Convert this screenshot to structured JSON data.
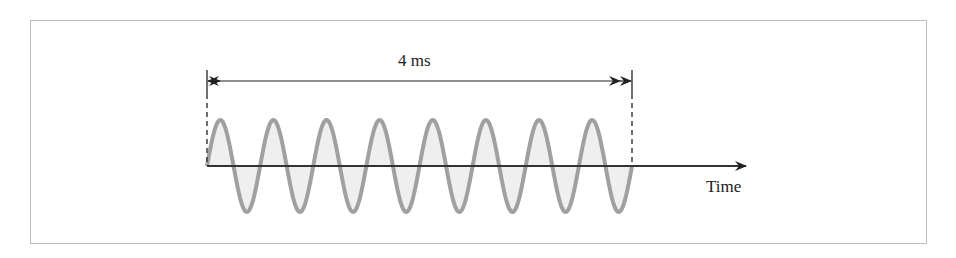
{
  "diagram": {
    "duration_label": "4 ms",
    "axis_label": "Time",
    "cycles": 8,
    "colors": {
      "wave_stroke": "#a0a0a0",
      "wave_fill": "#efefef",
      "axis": "#333333",
      "frame": "#bdbdbd"
    }
  }
}
